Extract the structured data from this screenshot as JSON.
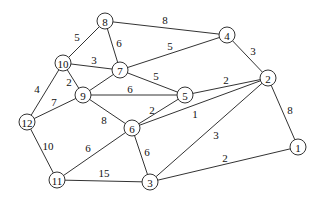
{
  "diagram": {
    "type": "weighted-undirected-graph",
    "nodes": [
      {
        "id": "1",
        "label": "1",
        "x": 298,
        "y": 147
      },
      {
        "id": "2",
        "label": "2",
        "x": 268,
        "y": 78
      },
      {
        "id": "3",
        "label": "3",
        "x": 150,
        "y": 182
      },
      {
        "id": "4",
        "label": "4",
        "x": 227,
        "y": 35
      },
      {
        "id": "5",
        "label": "5",
        "x": 185,
        "y": 95
      },
      {
        "id": "6",
        "label": "6",
        "x": 132,
        "y": 128
      },
      {
        "id": "7",
        "label": "7",
        "x": 120,
        "y": 70
      },
      {
        "id": "8",
        "label": "8",
        "x": 105,
        "y": 21
      },
      {
        "id": "9",
        "label": "9",
        "x": 83,
        "y": 95
      },
      {
        "id": "10",
        "label": "10",
        "x": 63,
        "y": 63
      },
      {
        "id": "11",
        "label": "11",
        "x": 57,
        "y": 180
      },
      {
        "id": "12",
        "label": "12",
        "x": 27,
        "y": 122
      }
    ],
    "edges": [
      {
        "from": "8",
        "to": "4",
        "weight": "8",
        "lx": 165,
        "ly": 20
      },
      {
        "from": "8",
        "to": "10",
        "weight": "5",
        "lx": 77,
        "ly": 37
      },
      {
        "from": "8",
        "to": "7",
        "weight": "6",
        "lx": 119,
        "ly": 43
      },
      {
        "from": "7",
        "to": "4",
        "weight": "5",
        "lx": 170,
        "ly": 46
      },
      {
        "from": "4",
        "to": "2",
        "weight": "3",
        "lx": 253,
        "ly": 51
      },
      {
        "from": "10",
        "to": "7",
        "weight": "3",
        "lx": 94,
        "ly": 60
      },
      {
        "from": "10",
        "to": "9",
        "weight": "2",
        "lx": 69,
        "ly": 82
      },
      {
        "from": "10",
        "to": "12",
        "weight": "4",
        "lx": 37,
        "ly": 89
      },
      {
        "from": "7",
        "to": "9",
        "weight": "",
        "lx": 0,
        "ly": 0
      },
      {
        "from": "7",
        "to": "5",
        "weight": "5",
        "lx": 156,
        "ly": 76
      },
      {
        "from": "5",
        "to": "2",
        "weight": "2",
        "lx": 226,
        "ly": 80
      },
      {
        "from": "9",
        "to": "5",
        "weight": "6",
        "lx": 130,
        "ly": 89
      },
      {
        "from": "9",
        "to": "12",
        "weight": "7",
        "lx": 54,
        "ly": 102
      },
      {
        "from": "9",
        "to": "6",
        "weight": "8",
        "lx": 104,
        "ly": 120
      },
      {
        "from": "6",
        "to": "5",
        "weight": "2",
        "lx": 152,
        "ly": 110
      },
      {
        "from": "6",
        "to": "2",
        "weight": "1",
        "lx": 195,
        "ly": 114
      },
      {
        "from": "2",
        "to": "1",
        "weight": "8",
        "lx": 290,
        "ly": 110
      },
      {
        "from": "2",
        "to": "3",
        "weight": "3",
        "lx": 216,
        "ly": 135
      },
      {
        "from": "12",
        "to": "11",
        "weight": "10",
        "lx": 48,
        "ly": 146
      },
      {
        "from": "11",
        "to": "6",
        "weight": "6",
        "lx": 88,
        "ly": 148
      },
      {
        "from": "6",
        "to": "3",
        "weight": "6",
        "lx": 147,
        "ly": 152
      },
      {
        "from": "11",
        "to": "3",
        "weight": "15",
        "lx": 104,
        "ly": 173
      },
      {
        "from": "3",
        "to": "1",
        "weight": "2",
        "lx": 225,
        "ly": 158
      }
    ]
  }
}
